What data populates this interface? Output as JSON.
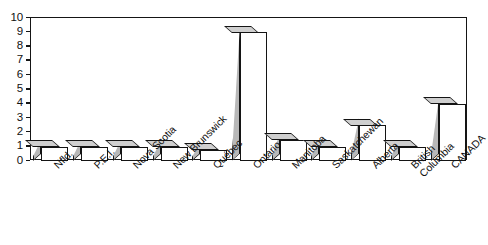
{
  "chart_data": {
    "type": "bar",
    "title": "",
    "subtitle": "",
    "xlabel": "",
    "ylabel": "",
    "ylim": [
      0,
      10
    ],
    "yticks": [
      0,
      1,
      2,
      3,
      4,
      5,
      6,
      7,
      8,
      9,
      10
    ],
    "ytick_labels": [
      "0",
      "1",
      "2",
      "3",
      "4",
      "5",
      "6",
      "7",
      "8",
      "9",
      "10"
    ],
    "grid": false,
    "legend": false,
    "legend_position": "none",
    "style": "3d-bar",
    "categories": [
      "Nfld.",
      "P.E.I.",
      "Nova Scotia",
      "New Brunswick",
      "Québec",
      "Ontario",
      "Manitoba",
      "Saskatchewan",
      "Alberta",
      "British Columbia",
      "CANADA"
    ],
    "category_lines": [
      [
        "Nfld."
      ],
      [
        "P.E.I."
      ],
      [
        "Nova Scotia"
      ],
      [
        "New Brunswick"
      ],
      [
        "Québec"
      ],
      [
        "Ontario"
      ],
      [
        "Manitoba"
      ],
      [
        "Saskatchewan"
      ],
      [
        "Alberta"
      ],
      [
        "British",
        "Columbia"
      ],
      [
        "CANADA"
      ]
    ],
    "values": [
      1.0,
      1.0,
      1.0,
      1.0,
      0.8,
      9.0,
      1.5,
      1.0,
      2.5,
      1.0,
      4.0
    ],
    "colors": {
      "bar_front": "#ffffff",
      "bar_side": "#b8b8b8",
      "bar_top": "#cfcfcf",
      "outline": "#141414",
      "axis": "#151515",
      "text": "#111111",
      "background": "#ffffff"
    }
  }
}
